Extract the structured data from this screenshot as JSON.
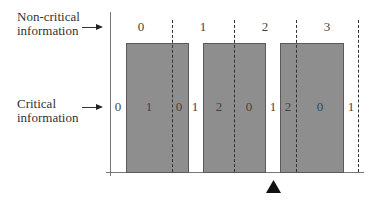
{
  "labels": {
    "non_critical_line1": "Non-critical",
    "non_critical_line2": "information",
    "critical_line1": "Critical",
    "critical_line2": "information"
  },
  "top_numbers": [
    "0",
    "1",
    "2",
    "3"
  ],
  "bottom_numbers": [
    "0",
    "1",
    "0",
    "1",
    "2",
    "0",
    "1",
    "2",
    "0",
    "1"
  ],
  "marker": "triangle-up",
  "colors": {
    "block_fill": "#8e8e8e",
    "block_border": "#5a5a5a",
    "axis": "#555555",
    "marker": "#111111"
  }
}
